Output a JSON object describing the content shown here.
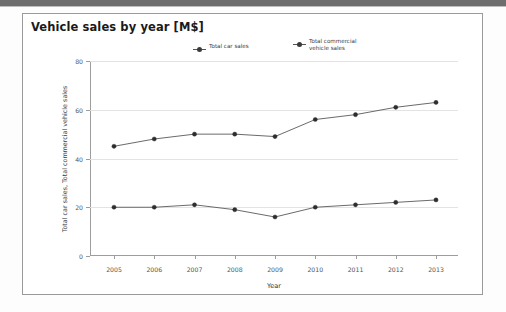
{
  "window": {
    "titlebar_color": "#6e6e6e"
  },
  "panel": {
    "title": "Vehicle sales by year [M$]",
    "border_color": "#9a9a9a"
  },
  "chart_data": {
    "type": "line",
    "title": "Vehicle sales by year [M$]",
    "xlabel": "Year",
    "ylabel": "Total car sales, Total commercial vehicle sales",
    "categories": [
      "2005",
      "2006",
      "2007",
      "2008",
      "2009",
      "2010",
      "2011",
      "2012",
      "2013"
    ],
    "x": [
      2005,
      2006,
      2007,
      2008,
      2009,
      2010,
      2011,
      2012,
      2013
    ],
    "ylim": [
      0,
      80
    ],
    "yticks": [
      0,
      20,
      40,
      60,
      80
    ],
    "grid": true,
    "legend_position": "top-center",
    "series": [
      {
        "name": "Total car sales",
        "color": "#595959",
        "marker": "circle",
        "values": [
          45,
          48,
          50,
          50,
          49,
          56,
          58,
          61,
          63
        ]
      },
      {
        "name": "Total commercial\nvehicle sales",
        "color": "#595959",
        "marker": "circle",
        "values": [
          20,
          20,
          21,
          19,
          16,
          20,
          21,
          22,
          23
        ]
      }
    ]
  }
}
